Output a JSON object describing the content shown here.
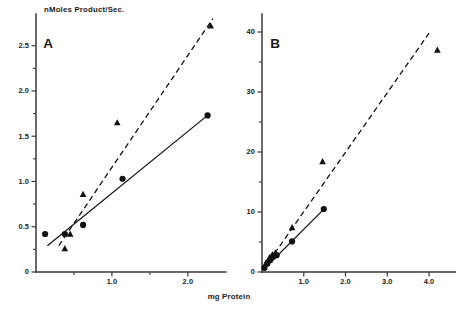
{
  "figure": {
    "shared_xlabel": "mg Protein",
    "shared_ylabel": "nMoles Product/Sec."
  },
  "chart_data": [
    {
      "type": "scatter",
      "panel": "A",
      "title": "A",
      "xlabel": "mg Protein",
      "ylabel": "nMoles Product/Sec.",
      "xlim": [
        0,
        2.45
      ],
      "ylim": [
        0,
        2.85
      ],
      "grid": false,
      "legend": "none",
      "xticks": [
        0.5,
        1.0,
        1.5,
        2.0
      ],
      "xtick_labels": [
        "",
        "1.0",
        "",
        "2.0"
      ],
      "yticks": [
        0,
        0.25,
        0.5,
        0.75,
        1.0,
        1.25,
        1.5,
        1.75,
        2.0,
        2.25,
        2.5
      ],
      "ytick_labels": [
        "0",
        "",
        "0.5",
        "",
        "1.0",
        "",
        "1.5",
        "",
        "2.0",
        "",
        "2.5"
      ],
      "series": [
        {
          "name": "circles",
          "marker": "filled-circle",
          "line": "solid",
          "x": [
            0.12,
            0.38,
            0.62,
            1.14,
            2.26
          ],
          "y": [
            0.42,
            0.42,
            0.52,
            1.03,
            1.73
          ],
          "fit_line": {
            "x": [
              0.15,
              2.26
            ],
            "y": [
              0.29,
              1.73
            ]
          }
        },
        {
          "name": "triangles",
          "marker": "filled-triangle",
          "line": "dashed",
          "x": [
            0.38,
            0.45,
            0.62,
            1.07,
            2.3
          ],
          "y": [
            0.26,
            0.42,
            0.86,
            1.65,
            2.72
          ],
          "fit_line": {
            "x": [
              0.3,
              2.33
            ],
            "y": [
              0.29,
              2.8
            ]
          }
        }
      ]
    },
    {
      "type": "scatter",
      "panel": "B",
      "title": "B",
      "xlabel": "mg Protein",
      "ylabel": "nMoles Product/Sec.",
      "xlim": [
        0,
        4.55
      ],
      "ylim": [
        0,
        43
      ],
      "grid": false,
      "legend": "none",
      "xticks": [
        1.0,
        2.0,
        3.0,
        4.0
      ],
      "xtick_labels": [
        "1.0",
        "2.0",
        "3.0",
        "4.0"
      ],
      "yticks": [
        0,
        5,
        10,
        15,
        20,
        25,
        30,
        35,
        40
      ],
      "ytick_labels": [
        "0",
        "",
        "10",
        "",
        "20",
        "",
        "30",
        "",
        "40"
      ],
      "series": [
        {
          "name": "circles",
          "marker": "filled-circle",
          "line": "solid",
          "x": [
            0.06,
            0.13,
            0.2,
            0.27,
            0.35,
            0.72,
            1.48
          ],
          "y": [
            0.7,
            1.4,
            2.0,
            2.6,
            2.8,
            5.1,
            10.5
          ],
          "fit_line": {
            "x": [
              0.05,
              1.5
            ],
            "y": [
              0.5,
              10.6
            ]
          }
        },
        {
          "name": "triangles",
          "marker": "filled-triangle",
          "line": "dashed",
          "x": [
            0.1,
            0.18,
            0.25,
            0.32,
            0.72,
            1.45,
            4.2
          ],
          "y": [
            1.6,
            2.4,
            2.9,
            3.2,
            7.4,
            18.4,
            37.0
          ],
          "fit_line": {
            "x": [
              0.05,
              4.0
            ],
            "y": [
              0.6,
              39.8
            ]
          }
        }
      ]
    }
  ]
}
